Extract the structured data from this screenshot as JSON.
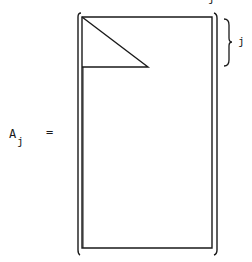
{
  "equation": {
    "lhs_symbol": "A",
    "lhs_subscript": "j",
    "operator": "="
  },
  "matrix": {
    "description": "Rectangular matrix in brackets with a triangular block in the upper-left corner spanning j rows",
    "brace_label": "j",
    "top_label": "j"
  },
  "colors": {
    "ink": "#1a1a1a",
    "background": "#ffffff"
  }
}
